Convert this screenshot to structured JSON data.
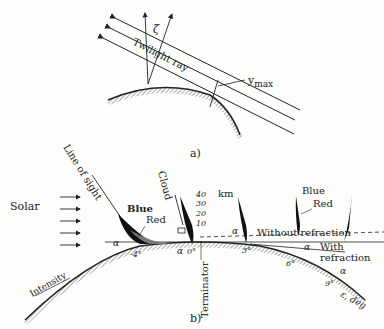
{
  "panel_a": {
    "caption": "a)",
    "ray_label": "Twilight ray",
    "zeta": "ζ",
    "ymax": "y",
    "ymax_sub": "max"
  },
  "panel_b": {
    "caption": "b)",
    "solar": "Solar",
    "line_of_sight": "Line of sight",
    "cloud": "Cloud",
    "blue_1": "Blue",
    "red_1": "Red",
    "blue_2": "Blue",
    "red_2": "Red",
    "alt_40": "40",
    "alt_30": "30",
    "alt_20": "20",
    "alt_10": "10",
    "km": "km",
    "terminator": "Terminator",
    "without_refraction": "Without refraction",
    "with_refraction_1": "With",
    "with_refraction_2": "refraction",
    "intensity": "Intensity",
    "alpha": "α",
    "deg_m4": "-4°",
    "deg_0": "0°",
    "deg_3": "3°",
    "deg_6": "6°",
    "deg_9": "9°",
    "axis": "ε, deg"
  }
}
